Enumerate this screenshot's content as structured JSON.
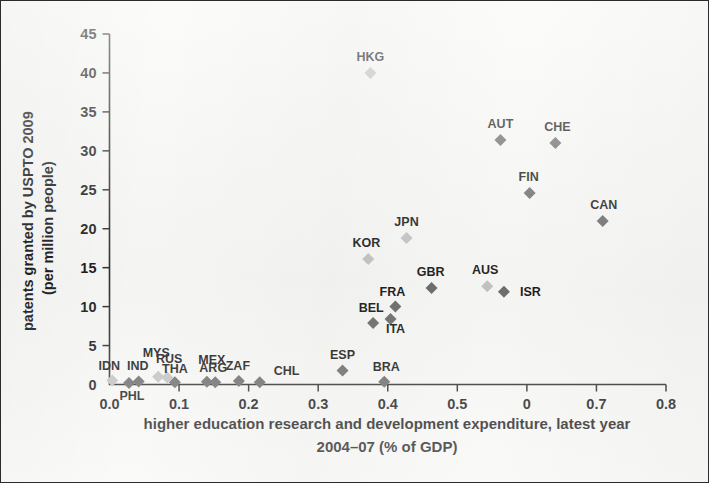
{
  "chart_data": {
    "type": "scatter",
    "title": "",
    "xlabel": "higher education research and development expenditure, latest year 2004–07 (% of GDP)",
    "xlabel_line1": "higher education research and development expenditure, latest year",
    "xlabel_line2": "2004–07 (% of GDP)",
    "ylabel": "patents granted by USPTO 2009 (per million people)",
    "ylabel_line1": "patents granted by USPTO 2009",
    "ylabel_line2": "(per million people)",
    "xlim": [
      0.0,
      0.8
    ],
    "ylim": [
      0,
      45
    ],
    "grid": false,
    "legend": "none",
    "xticks": [
      "0.0",
      "0.1",
      "0.2",
      "0.3",
      "0.4",
      "0.5",
      "0",
      "0.7",
      "0.8"
    ],
    "xtick_values": [
      0.0,
      0.1,
      0.2,
      0.3,
      0.4,
      0.5,
      0.6,
      0.7,
      0.8
    ],
    "yticks": [
      "0",
      "5",
      "10",
      "15",
      "20",
      "25",
      "30",
      "35",
      "40",
      "45"
    ],
    "ytick_values": [
      0,
      5,
      10,
      15,
      20,
      25,
      30,
      35,
      40,
      45
    ],
    "marker": "diamond",
    "marker_colors": {
      "dark": "#6e6e6e",
      "light": "#c3c3c3"
    },
    "points": [
      {
        "label": "HKG",
        "x": 0.375,
        "y": 40.0,
        "shade": "light",
        "lx": 0,
        "ly": -12
      },
      {
        "label": "AUT",
        "x": 0.562,
        "y": 31.4,
        "shade": "dark",
        "lx": 0,
        "ly": -12
      },
      {
        "label": "CHE",
        "x": 0.641,
        "y": 31.0,
        "shade": "dark",
        "lx": 2,
        "ly": -12
      },
      {
        "label": "FIN",
        "x": 0.604,
        "y": 24.6,
        "shade": "dark",
        "lx": -1,
        "ly": -12
      },
      {
        "label": "CAN",
        "x": 0.709,
        "y": 21.0,
        "shade": "dark",
        "lx": 1,
        "ly": -12
      },
      {
        "label": "JPN",
        "x": 0.427,
        "y": 18.8,
        "shade": "light",
        "lx": 0,
        "ly": -12
      },
      {
        "label": "KOR",
        "x": 0.372,
        "y": 16.1,
        "shade": "light",
        "lx": -2,
        "ly": -12
      },
      {
        "label": "AUS",
        "x": 0.543,
        "y": 12.6,
        "shade": "light",
        "lx": -2,
        "ly": -12
      },
      {
        "label": "GBR",
        "x": 0.463,
        "y": 12.4,
        "shade": "dark",
        "lx": -1,
        "ly": -12
      },
      {
        "label": "ISR",
        "x": 0.567,
        "y": 11.9,
        "shade": "dark",
        "lx": 16,
        "ly": 4
      },
      {
        "label": "FRA",
        "x": 0.411,
        "y": 10.0,
        "shade": "dark",
        "lx": -3,
        "ly": -11
      },
      {
        "label": "ITA",
        "x": 0.404,
        "y": 8.4,
        "shade": "dark",
        "lx": 5,
        "ly": 14
      },
      {
        "label": "BEL",
        "x": 0.379,
        "y": 7.9,
        "shade": "dark",
        "lx": -2,
        "ly": -11
      },
      {
        "label": "ESP",
        "x": 0.335,
        "y": 1.8,
        "shade": "dark",
        "lx": 0,
        "ly": -11
      },
      {
        "label": "BRA",
        "x": 0.395,
        "y": 0.35,
        "shade": "dark",
        "lx": 2,
        "ly": -11
      },
      {
        "label": "CHL",
        "x": 0.216,
        "y": 0.3,
        "shade": "dark",
        "lx": 14,
        "ly": -7
      },
      {
        "label": "ZAF",
        "x": 0.186,
        "y": 0.45,
        "shade": "dark",
        "lx": -1,
        "ly": -11
      },
      {
        "label": "ARG",
        "x": 0.152,
        "y": 0.3,
        "shade": "dark",
        "lx": -2,
        "ly": -10
      },
      {
        "label": "MEX",
        "x": 0.14,
        "y": 0.35,
        "shade": "dark",
        "lx": 5,
        "ly": -18
      },
      {
        "label": "THA",
        "x": 0.094,
        "y": 0.3,
        "shade": "dark",
        "lx": 0,
        "ly": -9
      },
      {
        "label": "RUS",
        "x": 0.083,
        "y": 0.9,
        "shade": "light",
        "lx": 2,
        "ly": -14
      },
      {
        "label": "MYS",
        "x": 0.07,
        "y": 1.0,
        "shade": "light",
        "lx": -2,
        "ly": -20
      },
      {
        "label": "IND",
        "x": 0.042,
        "y": 0.4,
        "shade": "dark",
        "lx": -1,
        "ly": -11
      },
      {
        "label": "PHL",
        "x": 0.028,
        "y": 0.2,
        "shade": "dark",
        "lx": 3,
        "ly": 17
      },
      {
        "label": "IDN",
        "x": 0.004,
        "y": 0.5,
        "shade": "light",
        "lx": -3,
        "ly": -11
      }
    ]
  }
}
